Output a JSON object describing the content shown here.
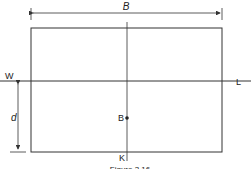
{
  "diagram": {
    "labels": {
      "breadth": "B",
      "depth": "d",
      "waterline_left": "W",
      "waterline_right": "L",
      "centre_of_buoyancy": "B",
      "keel": "K",
      "caption": "Figure 3.16"
    },
    "colors": {
      "line": "#333333",
      "background": "#ffffff"
    }
  }
}
